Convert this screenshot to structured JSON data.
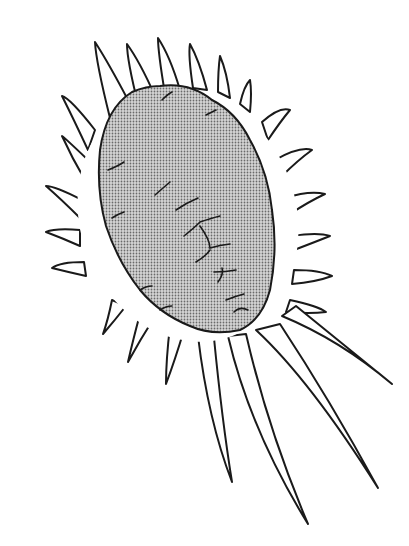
{
  "image": {
    "subject": "microorganism-illustration",
    "style": "black-and-white line drawing with stippled body",
    "colors": {
      "background": "#ffffff",
      "outline": "#1a1a1a",
      "body_fill": "#b8b8b8"
    }
  }
}
